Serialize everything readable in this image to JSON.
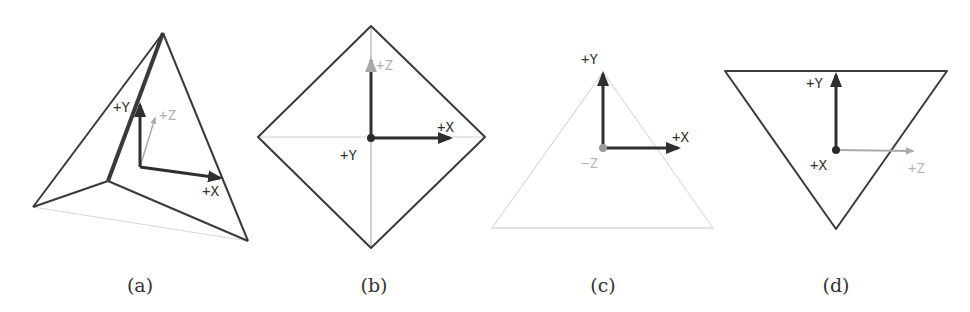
{
  "colors": {
    "edge": "#3a3a3a",
    "axis_dark": "#2f2f2f",
    "axis_light": "#a9a9a9",
    "faint_edge": "#d4d4d4",
    "label_dark": "#333333",
    "label_light": "#b0b0b0"
  },
  "panels": [
    {
      "id": "a",
      "caption": "(a)",
      "labels": {
        "y": "+Y",
        "x": "+X",
        "z": "+Z"
      }
    },
    {
      "id": "b",
      "caption": "(b)",
      "labels": {
        "z": "+Z",
        "x": "+X",
        "y": "+Y"
      }
    },
    {
      "id": "c",
      "caption": "(c)",
      "labels": {
        "y": "+Y",
        "x": "+X",
        "z": "−Z"
      }
    },
    {
      "id": "d",
      "caption": "(d)",
      "labels": {
        "y": "+Y",
        "x": "+X",
        "z": "+Z"
      }
    }
  ]
}
